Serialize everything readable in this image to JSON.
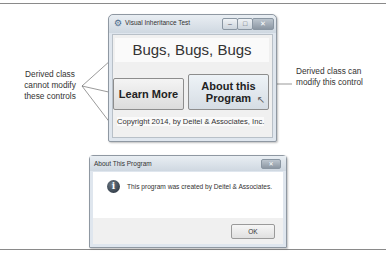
{
  "main_window": {
    "title": "Visual Inheritance Test",
    "controls": {
      "minimize": "–",
      "maximize": "□",
      "close": "✕"
    },
    "heading": "Bugs, Bugs, Bugs",
    "learn_more_label": "Learn More",
    "about_label_line1": "About this",
    "about_label_line2": "Program",
    "copyright": "Copyright 2014, by Deitel & Associates, Inc."
  },
  "annotations": {
    "left_line1": "Derived class",
    "left_line2": "cannot modify",
    "left_line3": "these controls",
    "right_line1": "Derived class can",
    "right_line2": "modify this control"
  },
  "dialog": {
    "title": "About This Program",
    "close": "✕",
    "icon": "i",
    "message": "This program was created by Deitel & Associates.",
    "ok_label": "OK"
  }
}
